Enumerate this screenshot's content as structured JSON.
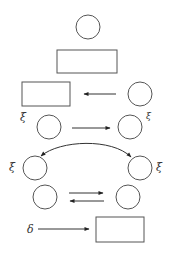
{
  "diagram": {
    "background": "#ffffff",
    "stroke_color": "#555555",
    "labels": {
      "xi": "ξ",
      "delta": "δ"
    },
    "nodes": [
      {
        "id": "top-circle",
        "type": "circle",
        "cx": 88,
        "cy": 27,
        "r": 12
      },
      {
        "id": "top-rect",
        "type": "rect",
        "x": 57,
        "y": 50,
        "w": 60,
        "h": 23
      },
      {
        "id": "row3-rect",
        "type": "rect",
        "x": 22,
        "y": 82,
        "w": 48,
        "h": 24
      },
      {
        "id": "row3-circle",
        "type": "circle",
        "cx": 140,
        "cy": 94,
        "r": 12
      },
      {
        "id": "row4-left-circle",
        "type": "circle",
        "cx": 49,
        "cy": 127,
        "r": 12,
        "label": "ξ",
        "label_side": "left"
      },
      {
        "id": "row4-right-circle",
        "type": "circle",
        "cx": 130,
        "cy": 127,
        "r": 12,
        "label": "ξ",
        "label_side": "right-superscript"
      },
      {
        "id": "row5-left-circle",
        "type": "circle",
        "cx": 35,
        "cy": 168,
        "r": 12,
        "label": "ξ",
        "label_side": "left"
      },
      {
        "id": "row5-right-circle",
        "type": "circle",
        "cx": 140,
        "cy": 168,
        "r": 12,
        "label": "ξ",
        "label_side": "right"
      },
      {
        "id": "row6-left-circle",
        "type": "circle",
        "cx": 45,
        "cy": 197,
        "r": 12
      },
      {
        "id": "row6-right-circle",
        "type": "circle",
        "cx": 128,
        "cy": 197,
        "r": 12
      },
      {
        "id": "bottom-rect",
        "type": "rect",
        "x": 96,
        "y": 217,
        "w": 48,
        "h": 25
      }
    ],
    "edges": [
      {
        "from": "row3-circle",
        "to": "row3-rect",
        "direction": "left"
      },
      {
        "from": "row4-left-circle",
        "to": "row4-right-circle",
        "direction": "right"
      },
      {
        "from": "row5-left-circle",
        "to": "row5-right-circle",
        "style": "curved",
        "heads": "both"
      },
      {
        "from": "row6-left-circle",
        "to": "row6-right-circle",
        "direction": "right"
      },
      {
        "from": "row6-right-circle",
        "to": "row6-left-circle",
        "direction": "left"
      },
      {
        "from": "delta-label",
        "to": "bottom-rect",
        "direction": "right"
      }
    ]
  }
}
